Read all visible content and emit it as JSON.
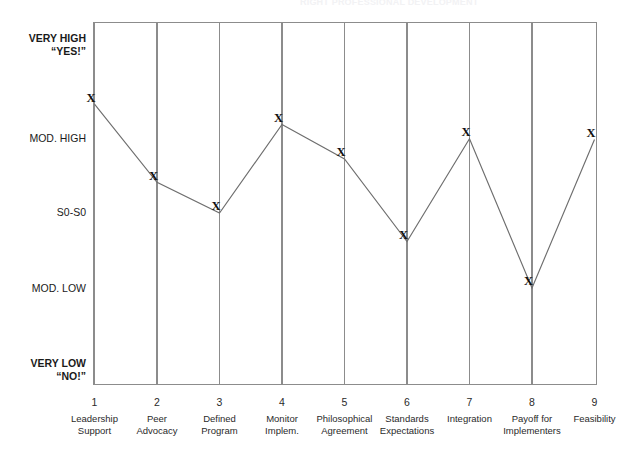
{
  "scan": {
    "header_fragment": "RIGHT PROFESSIONAL DEVELOPMENT"
  },
  "chart_data": {
    "type": "line",
    "title": "",
    "xlabel": "",
    "ylabel": "",
    "grid": true,
    "legend": "none",
    "categories": [
      "Leadership\nSupport",
      "Peer\nAdvocacy",
      "Defined\nProgram",
      "Monitor\nImplem.",
      "Philosophical\nAgreement",
      "Standards\nExpectations",
      "Integration",
      "Payoff for\nImplementers",
      "Feasibility"
    ],
    "x": [
      1,
      2,
      3,
      4,
      5,
      6,
      7,
      8,
      9
    ],
    "x_tick_labels": [
      "1",
      "2",
      "3",
      "4",
      "5",
      "6",
      "7",
      "8",
      "9"
    ],
    "y_tick_labels": [
      "VERY HIGH\n“YES!”",
      "MOD. HIGH",
      "S0-S0",
      "MOD. LOW",
      "VERY LOW\n“NO!”"
    ],
    "y_scale_levels": [
      5,
      4,
      3,
      2,
      1
    ],
    "ylim": [
      1,
      5
    ],
    "values": [
      4.45,
      3.41,
      3.0,
      4.18,
      3.72,
      2.62,
      3.99,
      2.0,
      3.98
    ],
    "marker": "X",
    "series_color": "#6e6e6e",
    "frame_color": "#8c8c8c"
  },
  "y_axis": {
    "labels": [
      {
        "line1": "VERY HIGH",
        "line2": "“YES!”",
        "bold": true
      },
      {
        "line1": "MOD. HIGH",
        "line2": "",
        "bold": false
      },
      {
        "line1": "S0-S0",
        "line2": "",
        "bold": false
      },
      {
        "line1": "MOD. LOW",
        "line2": "",
        "bold": false
      },
      {
        "line1": "VERY LOW",
        "line2": "“NO!”",
        "bold": true
      }
    ]
  },
  "x_axis": {
    "ticks": [
      {
        "num": "1",
        "caption": "Leadership\nSupport"
      },
      {
        "num": "2",
        "caption": "Peer\nAdvocacy"
      },
      {
        "num": "3",
        "caption": "Defined\nProgram"
      },
      {
        "num": "4",
        "caption": "Monitor\nImplem."
      },
      {
        "num": "5",
        "caption": "Philosophical\nAgreement"
      },
      {
        "num": "6",
        "caption": "Standards\nExpectations"
      },
      {
        "num": "7",
        "caption": "Integration"
      },
      {
        "num": "8",
        "caption": "Payoff for\nImplementers"
      },
      {
        "num": "9",
        "caption": "Feasibility"
      }
    ]
  }
}
